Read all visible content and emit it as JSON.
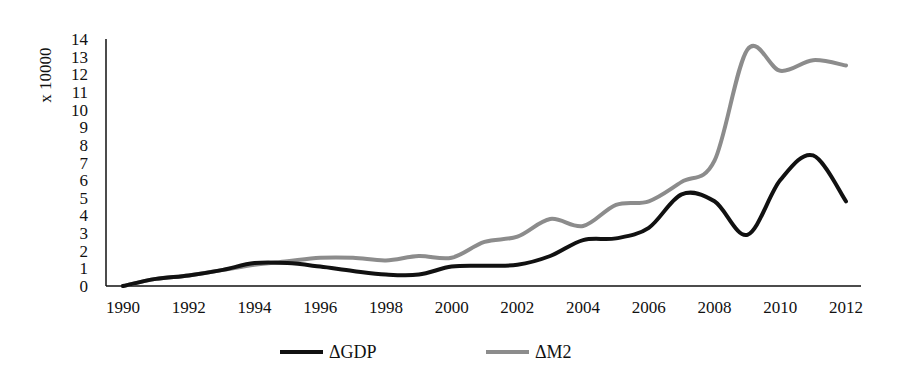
{
  "chart_data": {
    "type": "line",
    "title": "",
    "xlabel": "",
    "ylabel": "x 10000",
    "ylim": [
      0,
      14
    ],
    "yticks": [
      0,
      1,
      2,
      3,
      4,
      5,
      6,
      7,
      8,
      9,
      10,
      11,
      12,
      13,
      14
    ],
    "xlim": [
      1990,
      2012
    ],
    "xtick_labels": [
      "1990",
      "1992",
      "1994",
      "1996",
      "1998",
      "2000",
      "2002",
      "2004",
      "2006",
      "2008",
      "2010",
      "2012"
    ],
    "grid": false,
    "legend_position": "bottom",
    "x": [
      1990,
      1991,
      1992,
      1993,
      1994,
      1995,
      1996,
      1997,
      1998,
      1999,
      2000,
      2001,
      2002,
      2003,
      2004,
      2005,
      2006,
      2007,
      2008,
      2009,
      2010,
      2011,
      2012
    ],
    "series": [
      {
        "name": "ΔGDP",
        "color": "#111111",
        "values": [
          0,
          0.4,
          0.6,
          0.9,
          1.3,
          1.3,
          1.1,
          0.85,
          0.65,
          0.65,
          1.1,
          1.15,
          1.2,
          1.7,
          2.6,
          2.7,
          3.3,
          5.2,
          4.8,
          2.9,
          6.0,
          7.4,
          4.8
        ]
      },
      {
        "name": "ΔM2",
        "color": "#8c8c8c",
        "values": [
          0,
          0.4,
          0.6,
          0.9,
          1.2,
          1.4,
          1.6,
          1.6,
          1.45,
          1.7,
          1.6,
          2.5,
          2.8,
          3.8,
          3.4,
          4.6,
          4.8,
          5.9,
          7.1,
          13.4,
          12.2,
          12.8,
          12.5
        ]
      }
    ]
  },
  "legend": {
    "items": [
      {
        "label": "ΔGDP",
        "color": "#111111"
      },
      {
        "label": "ΔM2",
        "color": "#8c8c8c"
      }
    ]
  }
}
